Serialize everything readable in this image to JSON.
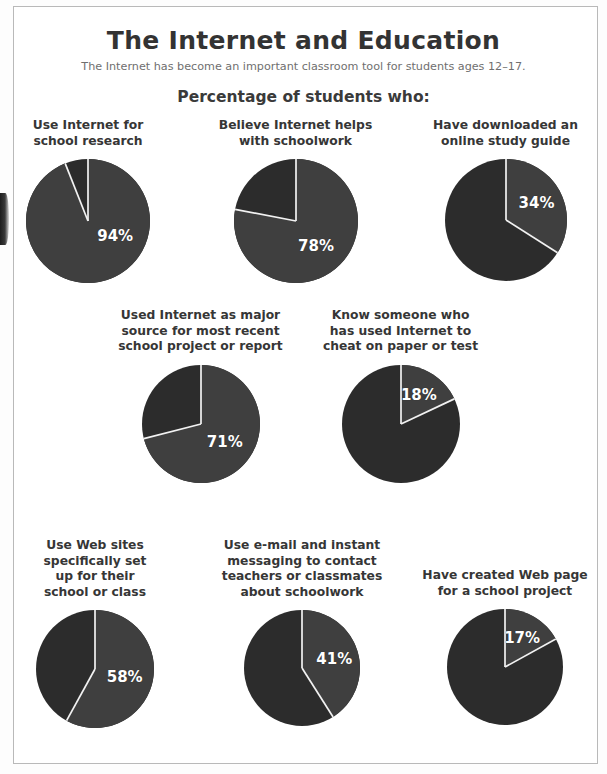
{
  "header": {
    "title": "The Internet and Education",
    "subtitle": "The Internet has become an important classroom tool for students ages 12–17.",
    "section_heading": "Percentage of students who:"
  },
  "colors": {
    "slice_main": "#3f3f3f",
    "slice_rest": "#2c2c2c",
    "divider": "#f2f2f2",
    "value_text": "#ffffff",
    "label_text": "#363636",
    "title_text": "#333333",
    "subtitle_text": "#6f6f6f",
    "frame_border": "#b9b9b9",
    "background": "#ffffff"
  },
  "chart_data": {
    "type": "pie",
    "title": "The Internet and Education",
    "subtitle": "The Internet has become an important classroom tool for students ages 12–17.",
    "section_heading": "Percentage of students who:",
    "units": "percent",
    "legend": "none",
    "charts": [
      {
        "id": "school-research",
        "label": "Use Internet for\nschool research",
        "value": 94,
        "value_label": "94%",
        "remainder": 6,
        "row": 1,
        "column": 1
      },
      {
        "id": "helps-schoolwork",
        "label": "Believe Internet helps\nwith schoolwork",
        "value": 78,
        "value_label": "78%",
        "remainder": 22,
        "row": 1,
        "column": 2
      },
      {
        "id": "online-study-guide",
        "label": "Have downloaded an\nonline study guide",
        "value": 34,
        "value_label": "34%",
        "remainder": 66,
        "row": 1,
        "column": 3
      },
      {
        "id": "major-source-project",
        "label": "Used Internet as major\nsource for most recent\nschool project or report",
        "value": 71,
        "value_label": "71%",
        "remainder": 29,
        "row": 2,
        "column": 1
      },
      {
        "id": "cheat-paper-test",
        "label": "Know someone who\nhas used Internet to\ncheat on paper or test",
        "value": 18,
        "value_label": "18%",
        "remainder": 82,
        "row": 2,
        "column": 2
      },
      {
        "id": "school-web-sites",
        "label": "Use Web sites\nspecifically set\nup for their\nschool or class",
        "value": 58,
        "value_label": "58%",
        "remainder": 42,
        "row": 3,
        "column": 1
      },
      {
        "id": "email-instant-messaging",
        "label": "Use e-mail and instant\nmessaging to contact\nteachers or classmates\nabout schoolwork",
        "value": 41,
        "value_label": "41%",
        "remainder": 59,
        "row": 3,
        "column": 2
      },
      {
        "id": "created-web-page",
        "label": "Have created Web page\nfor a school project",
        "value": 17,
        "value_label": "17%",
        "remainder": 83,
        "row": 3,
        "column": 3
      }
    ]
  }
}
